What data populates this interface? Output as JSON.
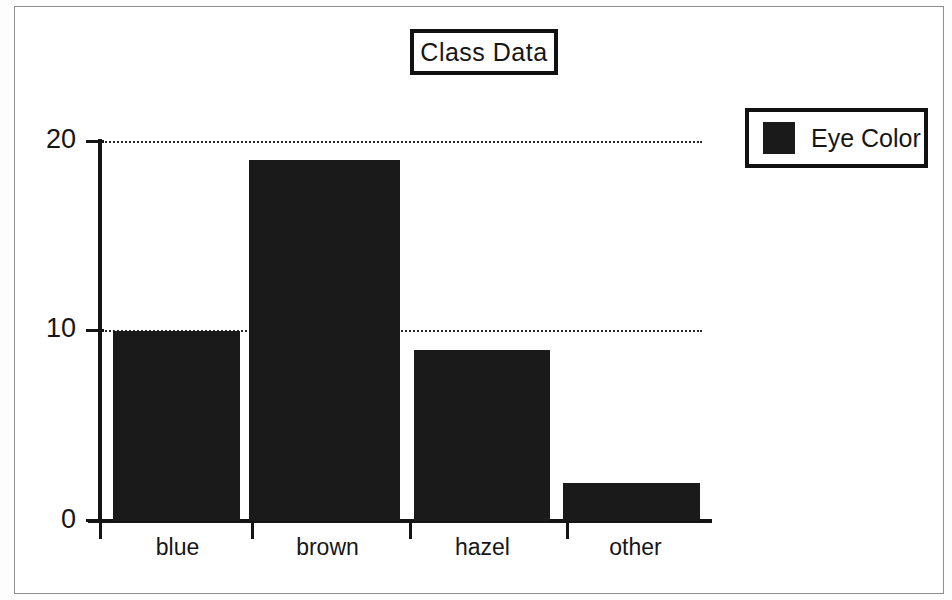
{
  "chart_data": {
    "type": "bar",
    "title": "Class Data",
    "categories": [
      "blue",
      "brown",
      "hazel",
      "other"
    ],
    "values": [
      10,
      19,
      9,
      2
    ],
    "series": [
      {
        "name": "Eye Color",
        "values": [
          10,
          19,
          9,
          2
        ],
        "color": "#1a1a1a"
      }
    ],
    "xlabel": "",
    "ylabel": "",
    "ylim": [
      0,
      20
    ],
    "ytick_labels": [
      "0",
      "10",
      "20"
    ],
    "ytick_values": [
      0,
      10,
      20
    ],
    "grid": true,
    "gridlines_at": [
      10,
      20
    ],
    "legend_position": "top-right",
    "legend_entries": [
      "Eye Color"
    ]
  },
  "title": {
    "text": "Class Data"
  },
  "legend": {
    "label": "Eye Color",
    "swatch_color": "#1a1a1a"
  },
  "axes": {
    "y_ticks": [
      {
        "label": "20",
        "value": 20
      },
      {
        "label": "10",
        "value": 10
      },
      {
        "label": "0",
        "value": 0
      }
    ],
    "x_ticks": [
      {
        "label": "blue"
      },
      {
        "label": "brown"
      },
      {
        "label": "hazel"
      },
      {
        "label": "other"
      }
    ]
  },
  "bars": [
    {
      "category": "blue",
      "value": 10
    },
    {
      "category": "brown",
      "value": 19
    },
    {
      "category": "hazel",
      "value": 9
    },
    {
      "category": "other",
      "value": 2
    }
  ]
}
